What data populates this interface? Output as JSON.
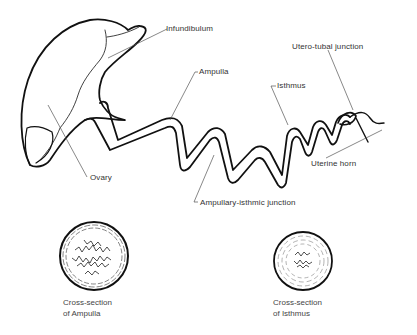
{
  "diagram": {
    "labels": {
      "infundibulum": "Infundibulum",
      "ampulla": "Ampulla",
      "isthmus": "Isthmus",
      "utero_tubal_junction": "Utero-tubal junction",
      "uterine_horn": "Uterine horn",
      "ovary": "Ovary",
      "ampullary_isthmic_junction": "Ampullary-isthmic junction"
    },
    "cross_sections": [
      {
        "line1": "Cross-section",
        "line2": "of Ampulla"
      },
      {
        "line1": "Cross-section",
        "line2": "of Isthmus"
      }
    ],
    "colors": {
      "stroke": "#111111",
      "leader": "#555555",
      "text": "#333333",
      "background": "#ffffff"
    }
  }
}
